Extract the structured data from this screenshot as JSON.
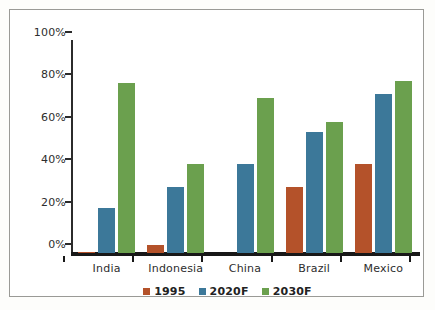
{
  "chart_data": {
    "type": "bar",
    "title": "",
    "subtitle": "",
    "xlabel": "",
    "ylabel": "",
    "ylim": [
      0,
      100
    ],
    "yticks": [
      "0%",
      "20%",
      "40%",
      "60%",
      "80%",
      "100%"
    ],
    "ytick_values": [
      0,
      20,
      40,
      60,
      80,
      100
    ],
    "grid": false,
    "legend_position": "bottom",
    "categories": [
      "India",
      "Indonesia",
      "China",
      "Brazil",
      "Mexico"
    ],
    "series": [
      {
        "name": "1995",
        "color": "#b4522a",
        "values": [
          0.5,
          4,
          0,
          31,
          42
        ]
      },
      {
        "name": "2020F",
        "color": "#3c7899",
        "values": [
          21,
          31,
          42,
          57,
          75
        ]
      },
      {
        "name": "2030F",
        "color": "#6ba04e",
        "values": [
          80,
          42,
          73,
          62,
          81
        ]
      }
    ]
  },
  "axis": {
    "y_labels": [
      "100%",
      "80%",
      "60%",
      "40%",
      "20%",
      "0%"
    ]
  },
  "legend": {
    "items": [
      {
        "label": "1995",
        "color": "#b4522a"
      },
      {
        "label": "2020F",
        "color": "#3c7899"
      },
      {
        "label": "2030F",
        "color": "#6ba04e"
      }
    ]
  }
}
